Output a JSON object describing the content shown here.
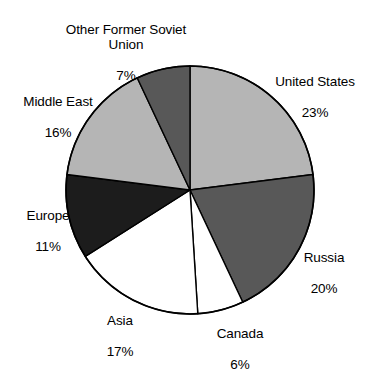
{
  "chart_data": {
    "type": "pie",
    "title": "",
    "subtitle": "",
    "xlabel": "",
    "ylabel": "",
    "legend_position": "none",
    "grid": false,
    "units": "%",
    "start_angle_deg": 0,
    "direction": "clockwise",
    "categories": [
      "United States",
      "Russia",
      "Canada",
      "Asia",
      "Europe",
      "Middle East",
      "Other Former Soviet Union"
    ],
    "values": [
      23,
      20,
      6,
      17,
      11,
      16,
      7
    ],
    "labels": [
      "United States\n23%",
      "Russia\n20%",
      "Canada\n6%",
      "Asia\n17%",
      "Europe\n11%",
      "Middle East\n16%",
      "Other Former Soviet\nUnion\n7%"
    ],
    "slices": [
      {
        "name": "United States",
        "value": 23,
        "value_label": "23%",
        "color": "#b5b5b5",
        "start_deg": 0,
        "end_deg": 82.8
      },
      {
        "name": "Russia",
        "value": 20,
        "value_label": "20%",
        "color": "#585858",
        "start_deg": 82.8,
        "end_deg": 154.8
      },
      {
        "name": "Canada",
        "value": 6,
        "value_label": "6%",
        "color": "#ffffff",
        "start_deg": 154.8,
        "end_deg": 176.4
      },
      {
        "name": "Asia",
        "value": 17,
        "value_label": "17%",
        "color": "#ffffff",
        "start_deg": 176.4,
        "end_deg": 237.6
      },
      {
        "name": "Europe",
        "value": 11,
        "value_label": "11%",
        "color": "#1c1c1c",
        "start_deg": 237.6,
        "end_deg": 277.2
      },
      {
        "name": "Middle East",
        "value": 16,
        "value_label": "16%",
        "color": "#b5b5b5",
        "start_deg": 277.2,
        "end_deg": 334.8
      },
      {
        "name": "Other Former Soviet Union",
        "value": 7,
        "value_label": "7%",
        "color": "#585858",
        "start_deg": 334.8,
        "end_deg": 360
      }
    ]
  },
  "labels": {
    "united_states": {
      "name": "United States",
      "value": "23%"
    },
    "russia": {
      "name": "Russia",
      "value": "20%"
    },
    "canada": {
      "name": "Canada",
      "value": "6%"
    },
    "asia": {
      "name": "Asia",
      "value": "17%"
    },
    "europe": {
      "name": "Europe",
      "value": "11%"
    },
    "middle_east": {
      "name": "Middle East",
      "value": "16%"
    },
    "other_former_soviet_union": {
      "name": "Other Former Soviet\nUnion",
      "value": "7%"
    }
  },
  "style": {
    "outline_color": "#000000",
    "background": "#ffffff",
    "light_gray": "#b5b5b5",
    "dark_gray": "#585858",
    "near_black": "#1c1c1c",
    "white": "#ffffff"
  }
}
